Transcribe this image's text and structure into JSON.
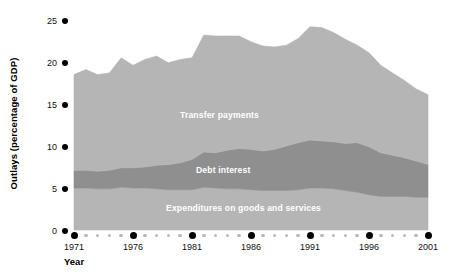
{
  "chart_data": {
    "type": "area",
    "title": "",
    "subtitle": "",
    "xlabel": "Year",
    "ylabel": "Outlays (percentage of GDP)",
    "xlim": [
      1971,
      2001
    ],
    "ylim": [
      0,
      25
    ],
    "grid": false,
    "stacked": true,
    "legend_position": "inline-labels",
    "y_ticks": [
      0,
      5,
      10,
      15,
      20,
      25
    ],
    "y_tick_labels": [
      "0",
      "5",
      "10",
      "15",
      "20",
      "25"
    ],
    "x_major_ticks": [
      1971,
      1976,
      1981,
      1986,
      1991,
      1996,
      2001
    ],
    "x_major_tick_labels": [
      "1971",
      "1976",
      "1981",
      "1986",
      "1991",
      "1996",
      "2001"
    ],
    "x_minor_ticks": [
      1972,
      1973,
      1974,
      1975,
      1977,
      1978,
      1979,
      1980,
      1982,
      1983,
      1984,
      1985,
      1987,
      1988,
      1989,
      1990,
      1992,
      1993,
      1994,
      1995,
      1997,
      1998,
      1999,
      2000
    ],
    "x": [
      1971,
      1972,
      1973,
      1974,
      1975,
      1976,
      1977,
      1978,
      1979,
      1980,
      1981,
      1982,
      1983,
      1984,
      1985,
      1986,
      1987,
      1988,
      1989,
      1990,
      1991,
      1992,
      1993,
      1994,
      1995,
      1996,
      1997,
      1998,
      1999,
      2000,
      2001
    ],
    "series": [
      {
        "name": "Expenditures on goods and services",
        "color": "#b5b5b5",
        "label_color": "#ffffff",
        "values": [
          5.0,
          5.0,
          4.9,
          4.9,
          5.1,
          5.0,
          5.0,
          4.9,
          4.8,
          4.8,
          4.8,
          5.1,
          5.0,
          4.9,
          4.9,
          4.8,
          4.7,
          4.7,
          4.7,
          4.8,
          5.0,
          5.0,
          4.9,
          4.7,
          4.5,
          4.2,
          4.0,
          4.0,
          4.0,
          3.9,
          3.9
        ]
      },
      {
        "name": "Debt interest",
        "color": "#8f8f8f",
        "label_color": "#ffffff",
        "values": [
          2.1,
          2.1,
          2.1,
          2.2,
          2.3,
          2.4,
          2.5,
          2.8,
          3.0,
          3.2,
          3.6,
          4.2,
          4.2,
          4.6,
          4.8,
          4.8,
          4.7,
          4.9,
          5.3,
          5.6,
          5.7,
          5.6,
          5.6,
          5.6,
          5.9,
          5.7,
          5.2,
          4.9,
          4.6,
          4.3,
          3.9
        ]
      },
      {
        "name": "Transfer payments",
        "color": "#b5b5b5",
        "label_color": "#ffffff",
        "values": [
          11.4,
          12.0,
          11.5,
          11.6,
          13.1,
          12.2,
          12.8,
          13.0,
          12.1,
          12.3,
          12.1,
          13.9,
          13.9,
          13.6,
          13.4,
          12.8,
          12.5,
          12.2,
          12.0,
          12.4,
          13.5,
          13.5,
          13.0,
          12.4,
          11.6,
          11.2,
          10.4,
          9.8,
          9.2,
          8.6,
          8.3
        ]
      }
    ],
    "totals": [
      18.5,
      19.1,
      18.5,
      18.7,
      20.5,
      19.6,
      20.3,
      20.7,
      19.9,
      20.3,
      20.5,
      23.2,
      23.1,
      23.1,
      23.1,
      22.4,
      21.9,
      21.8,
      22.0,
      22.8,
      24.2,
      24.1,
      23.5,
      22.7,
      22.0,
      21.1,
      19.6,
      18.7,
      17.8,
      16.8,
      16.1
    ]
  },
  "series_labels": [
    {
      "name": "transfer-payments",
      "text": "Transfer payments"
    },
    {
      "name": "debt-interest",
      "text": "Debt interest"
    },
    {
      "name": "expenditures",
      "text": "Expenditures on goods and services"
    }
  ]
}
